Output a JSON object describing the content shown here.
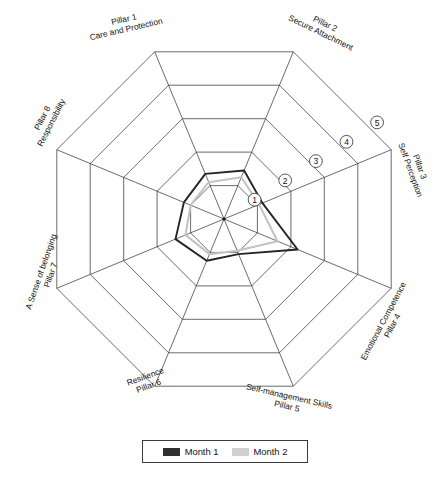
{
  "legend": {
    "items": [
      {
        "label": "Month 1",
        "color": "#2e2e33",
        "key": "month1"
      },
      {
        "label": "Month 2",
        "color": "#cfcfcf",
        "key": "month2"
      }
    ]
  },
  "ring_labels": [
    "1",
    "2",
    "3",
    "4",
    "5"
  ],
  "axis_labels": [
    {
      "line1": "Pillar 1",
      "line2": "Care and Protection"
    },
    {
      "line1": "Pillar 2",
      "line2": "Secure Attachment"
    },
    {
      "line1": "Pillar 3",
      "line2": "Self Perception"
    },
    {
      "line1": "Emotional Competence",
      "line2": "Pillar 4"
    },
    {
      "line1": "Self-management Skills",
      "line2": "Pillar 5"
    },
    {
      "line1": "Resilience",
      "line2": "Pillar 6"
    },
    {
      "line1": "A Sense of belonging",
      "line2": "Pillar 7"
    },
    {
      "line1": "Pillar 8",
      "line2": "Responsibility"
    }
  ],
  "chart_data": {
    "type": "radar",
    "title": "",
    "categories": [
      "Pillar 1 Care and Protection",
      "Pillar 2 Secure Attachment",
      "Pillar 3 Self Perception",
      "Pillar 4 Emotional Competence",
      "Pillar 5 Self-management Skills",
      "Pillar 6 Resilience",
      "Pillar 7 A Sense of belonging",
      "Pillar 8 Responsibility"
    ],
    "series": [
      {
        "name": "Month 1",
        "color": "#23232b",
        "values": [
          1.35,
          1.45,
          1.15,
          2.2,
          1.05,
          1.25,
          1.45,
          1.2
        ]
      },
      {
        "name": "Month 2",
        "color": "#c3c3c3",
        "values": [
          1.1,
          1.25,
          1.05,
          1.6,
          0.95,
          1.05,
          1.15,
          1.0
        ]
      }
    ],
    "rlim": [
      0,
      5
    ],
    "rticks": [
      1,
      2,
      3,
      4,
      5
    ],
    "grid": true,
    "legend_position": "bottom"
  }
}
